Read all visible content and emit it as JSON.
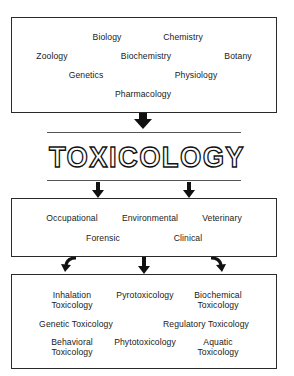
{
  "diagram": {
    "title": "TOXICOLOGY",
    "source_disciplines": {
      "items": [
        "Biology",
        "Chemistry",
        "Zoology",
        "Biochemistry",
        "Botany",
        "Genetics",
        "Physiology",
        "Pharmacology"
      ]
    },
    "application_areas": {
      "items": [
        "Occupational",
        "Environmental",
        "Veterinary",
        "Forensic",
        "Clinical"
      ]
    },
    "subspecialties": {
      "items": [
        {
          "line1": "Inhalation",
          "line2": "Toxicology"
        },
        {
          "line1": "Pyrotoxicology",
          "line2": ""
        },
        {
          "line1": "Biochemical",
          "line2": "Toxicology"
        },
        {
          "line1": "Genetic Toxicology",
          "line2": ""
        },
        {
          "line1": "Regulatory Toxicology",
          "line2": ""
        },
        {
          "line1": "Behavioral",
          "line2": "Toxicology"
        },
        {
          "line1": "Phytotoxicology",
          "line2": ""
        },
        {
          "line1": "Aquatic",
          "line2": "Toxicology"
        }
      ]
    },
    "flow": [
      {
        "from": "source_disciplines",
        "to": "title",
        "arrow": "down-large"
      },
      {
        "from": "title",
        "to": "application_areas",
        "arrow": "down-small x2"
      },
      {
        "from": "application_areas",
        "to": "subspecialties",
        "arrow": "curved-left, down, curved-right"
      }
    ]
  }
}
